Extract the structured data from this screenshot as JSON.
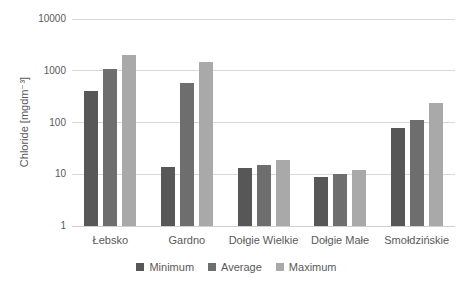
{
  "chart_data": {
    "type": "bar",
    "title": "",
    "ylabel": "Chloride [mgdm⁻³]",
    "xlabel": "",
    "y_scale": "log",
    "ylim": [
      1,
      10000
    ],
    "yticks": [
      1,
      10,
      100,
      1000,
      10000
    ],
    "grid": true,
    "legend_position": "bottom",
    "categories": [
      "Łebsko",
      "Gardno",
      "Dołgie Wielkie",
      "Dołgie Małe",
      "Smołdzińskie"
    ],
    "series": [
      {
        "name": "Minimum",
        "color": "#575757",
        "values": [
          400,
          14,
          13,
          9,
          80
        ]
      },
      {
        "name": "Average",
        "color": "#6e6e6e",
        "values": [
          1100,
          570,
          15,
          10,
          110
        ]
      },
      {
        "name": "Maximum",
        "color": "#a9a9a9",
        "values": [
          2000,
          1500,
          19,
          12,
          240
        ]
      }
    ]
  },
  "colors": {
    "text": "#595959",
    "gridline": "#d9d9d9",
    "axis_line": "#cfcfcf",
    "background": "#ffffff"
  }
}
